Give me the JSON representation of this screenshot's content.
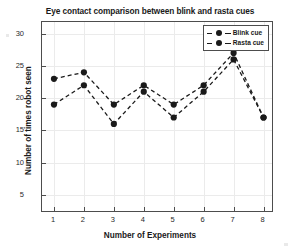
{
  "figure": {
    "background_color": "#ffffff",
    "axis_color": "#4d4d4d",
    "grid_color": "#ebebeb",
    "series_color": "#1a1a1a"
  },
  "chart_data": {
    "type": "line",
    "title": "Eye contact comparison between blink and rasta cues",
    "xlabel": "Number of Experiments",
    "ylabel": "Number of times robot seen",
    "x": [
      1,
      2,
      3,
      4,
      5,
      6,
      7,
      8
    ],
    "categories": [
      "1",
      "2",
      "3",
      "4",
      "5",
      "6",
      "7",
      "8"
    ],
    "xlim": [
      0.6,
      8.35
    ],
    "ylim": [
      2.2,
      31.8
    ],
    "xticks": [
      1,
      2,
      3,
      4,
      5,
      6,
      7,
      8
    ],
    "xticklabels": [
      "1",
      "2",
      "3",
      "4",
      "5",
      "6",
      "7",
      "8"
    ],
    "yticks": [
      5,
      10,
      15,
      20,
      25,
      30
    ],
    "yticklabels": [
      "5",
      "10",
      "15",
      "20",
      "25",
      "30"
    ],
    "grid": true,
    "legend_position": "top-right",
    "linestyle": "dashed",
    "marker": "filled-circle",
    "series": [
      {
        "name": "Blink cue",
        "color": "#1a1a1a",
        "values": [
          23,
          24,
          19,
          22,
          19,
          22,
          27,
          17
        ]
      },
      {
        "name": "Rasta cue",
        "color": "#1a1a1a",
        "values": [
          19,
          22,
          16,
          21,
          17,
          21,
          26,
          17
        ]
      }
    ]
  },
  "legend": {
    "items": [
      {
        "label": "Blink cue"
      },
      {
        "label": "Rasta cue"
      }
    ]
  }
}
